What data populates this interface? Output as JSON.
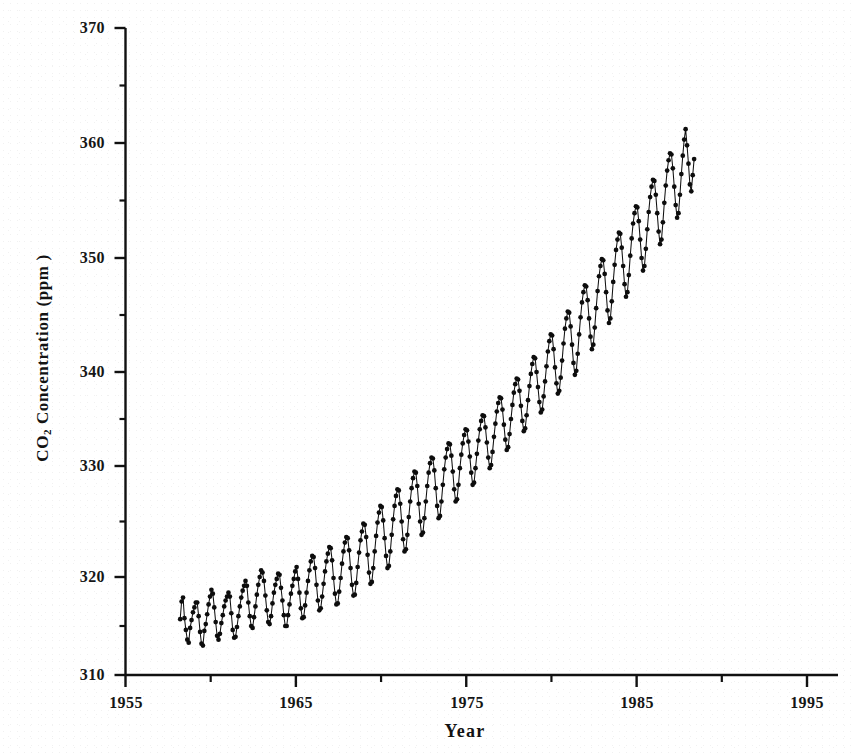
{
  "chart_data": {
    "type": "line",
    "title": "",
    "subtitle": "",
    "xlabel": "Year",
    "ylabel": "CO2 Concentration (ppm )",
    "ylabel_parts": {
      "prefix": "CO",
      "sub": "2",
      "suffix": " Concentration (ppm )"
    },
    "xlim": [
      1955,
      1997
    ],
    "ylim": [
      310,
      370
    ],
    "xticks": [
      1955,
      1965,
      1975,
      1985,
      1995
    ],
    "xtick_labels": [
      "1955",
      "1965",
      "1975",
      "1985",
      "1995"
    ],
    "xminor_ticks": [
      1960,
      1970,
      1980,
      1990
    ],
    "yticks": [
      310,
      320,
      330,
      340,
      350,
      360,
      370
    ],
    "ytick_labels": [
      "310",
      "320",
      "330",
      "340",
      "350",
      "360",
      "370"
    ],
    "yminor_ticks": [
      315,
      325,
      335,
      345,
      355,
      365
    ],
    "grid": false,
    "legend": null,
    "marker": "filled-circle",
    "line_color": "#111111",
    "marker_color": "#0d0d0d",
    "axis_color": "#111111",
    "background_color": "#ffffff",
    "series": [
      {
        "name": "Mauna Loa monthly mean CO2",
        "x_start": 1958.21,
        "x_step": 0.08333,
        "values": [
          315.7,
          317.5,
          317.9,
          315.8,
          314.6,
          313.6,
          313.3,
          314.8,
          315.6,
          316.4,
          316.9,
          317.4,
          317.4,
          316.0,
          314.4,
          313.2,
          313.0,
          314.5,
          315.2,
          316.2,
          317.2,
          318.0,
          318.7,
          318.3,
          316.9,
          315.4,
          314.0,
          313.6,
          314.2,
          315.3,
          316.1,
          317.0,
          317.6,
          318.0,
          318.4,
          318.0,
          316.3,
          314.6,
          313.8,
          313.9,
          314.9,
          316.0,
          317.0,
          317.9,
          318.6,
          319.1,
          319.6,
          319.1,
          317.4,
          316.0,
          315.0,
          314.8,
          315.9,
          317.0,
          318.2,
          319.2,
          320.0,
          320.6,
          320.4,
          319.6,
          318.1,
          316.6,
          315.4,
          315.2,
          316.0,
          317.3,
          318.4,
          319.2,
          319.8,
          320.3,
          320.2,
          318.9,
          317.6,
          316.1,
          315.0,
          315.0,
          316.1,
          317.2,
          318.3,
          319.1,
          319.8,
          320.5,
          320.9,
          319.8,
          318.4,
          316.8,
          315.8,
          315.9,
          317.1,
          318.4,
          319.6,
          320.6,
          321.4,
          321.9,
          321.8,
          320.8,
          319.2,
          317.6,
          316.6,
          316.8,
          318.0,
          319.3,
          320.5,
          321.4,
          322.1,
          322.7,
          322.6,
          321.5,
          319.9,
          318.3,
          317.2,
          317.3,
          318.5,
          319.9,
          321.2,
          322.3,
          323.1,
          323.6,
          323.5,
          322.4,
          320.8,
          319.2,
          318.1,
          318.2,
          319.4,
          320.9,
          322.2,
          323.3,
          324.1,
          324.8,
          324.7,
          323.6,
          322.0,
          320.4,
          319.3,
          319.5,
          320.8,
          322.3,
          323.7,
          324.9,
          325.8,
          326.4,
          326.3,
          325.1,
          323.5,
          321.9,
          320.8,
          321.0,
          322.3,
          323.8,
          325.2,
          326.4,
          327.3,
          327.9,
          327.8,
          326.6,
          325.0,
          323.4,
          322.3,
          322.5,
          323.8,
          325.4,
          326.8,
          328.0,
          328.9,
          329.5,
          329.4,
          328.2,
          326.6,
          325.0,
          323.8,
          324.0,
          325.3,
          326.8,
          328.2,
          329.4,
          330.3,
          330.9,
          330.8,
          329.6,
          328.0,
          326.4,
          325.3,
          325.5,
          326.8,
          328.3,
          329.7,
          330.9,
          331.8,
          332.4,
          332.3,
          331.1,
          329.5,
          327.9,
          326.8,
          327.0,
          328.3,
          329.8,
          331.2,
          332.4,
          333.3,
          333.9,
          333.8,
          332.6,
          331.0,
          329.4,
          328.3,
          328.5,
          329.8,
          331.3,
          332.7,
          333.9,
          334.8,
          335.4,
          335.3,
          334.1,
          332.5,
          330.9,
          329.8,
          330.1,
          331.5,
          333.1,
          334.5,
          335.8,
          336.7,
          337.3,
          337.2,
          336.0,
          334.4,
          332.8,
          331.7,
          332.0,
          333.4,
          335.0,
          336.5,
          337.8,
          338.7,
          339.3,
          339.2,
          338.0,
          336.4,
          334.8,
          333.7,
          334.0,
          335.4,
          337.0,
          338.5,
          339.8,
          340.7,
          341.3,
          341.2,
          340.0,
          338.4,
          336.8,
          335.7,
          336.0,
          337.4,
          339.0,
          340.5,
          341.8,
          342.7,
          343.3,
          343.2,
          342.0,
          340.4,
          338.8,
          337.7,
          338.0,
          339.4,
          341.0,
          342.5,
          343.8,
          344.7,
          345.3,
          345.2,
          344.0,
          342.4,
          340.8,
          339.7,
          340.1,
          341.6,
          343.3,
          344.8,
          346.1,
          347.0,
          347.6,
          347.5,
          346.3,
          344.7,
          343.1,
          342.0,
          342.4,
          343.9,
          345.6,
          347.1,
          348.4,
          349.3,
          349.9,
          349.8,
          348.6,
          347.0,
          345.4,
          344.3,
          344.7,
          346.2,
          347.9,
          349.4,
          350.7,
          351.6,
          352.2,
          352.1,
          350.9,
          349.3,
          347.7,
          346.6,
          347.0,
          348.5,
          350.2,
          351.7,
          353.0,
          353.9,
          354.5,
          354.4,
          353.2,
          351.6,
          350.0,
          348.9,
          349.3,
          350.8,
          352.5,
          354.0,
          355.3,
          356.2,
          356.8,
          356.7,
          355.5,
          353.9,
          352.3,
          351.2,
          351.6,
          353.1,
          354.8,
          356.3,
          357.6,
          358.5,
          359.1,
          359.0,
          357.8,
          356.2,
          354.6,
          353.5,
          353.9,
          355.5,
          357.3,
          358.9,
          360.3,
          361.2,
          359.8,
          358.2,
          356.4,
          355.8,
          357.2,
          358.6
        ]
      }
    ],
    "notes": {
      "peak_to_trough_amplitude_ppm": 6,
      "sampling": "monthly",
      "first_year_observed": 1958,
      "last_year_observed": 1995,
      "first_value_ppm": 315.7,
      "last_value_ppm": 358.6,
      "max_value_ppm": 361.2,
      "min_value_ppm": 313.0
    }
  },
  "ghost_artifact": {
    "line1": "",
    "line2": ""
  }
}
